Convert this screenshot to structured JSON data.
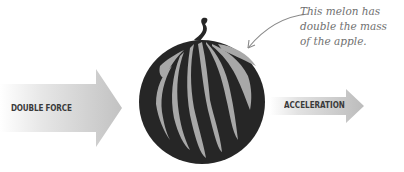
{
  "diagram": {
    "left_arrow": {
      "label": "DOUBLE FORCE"
    },
    "right_arrow": {
      "label": "ACCELERATION"
    },
    "object": {
      "name": "melon"
    },
    "annotation": {
      "lines": [
        "This melon has",
        "double the mass",
        "of the apple."
      ]
    },
    "colors": {
      "melon_dark": "#262626",
      "melon_stripe": "#a8a8a8",
      "arrow_gray": "#bdbdbd",
      "label_text": "#3a3a3a",
      "note_text": "#707070"
    }
  }
}
